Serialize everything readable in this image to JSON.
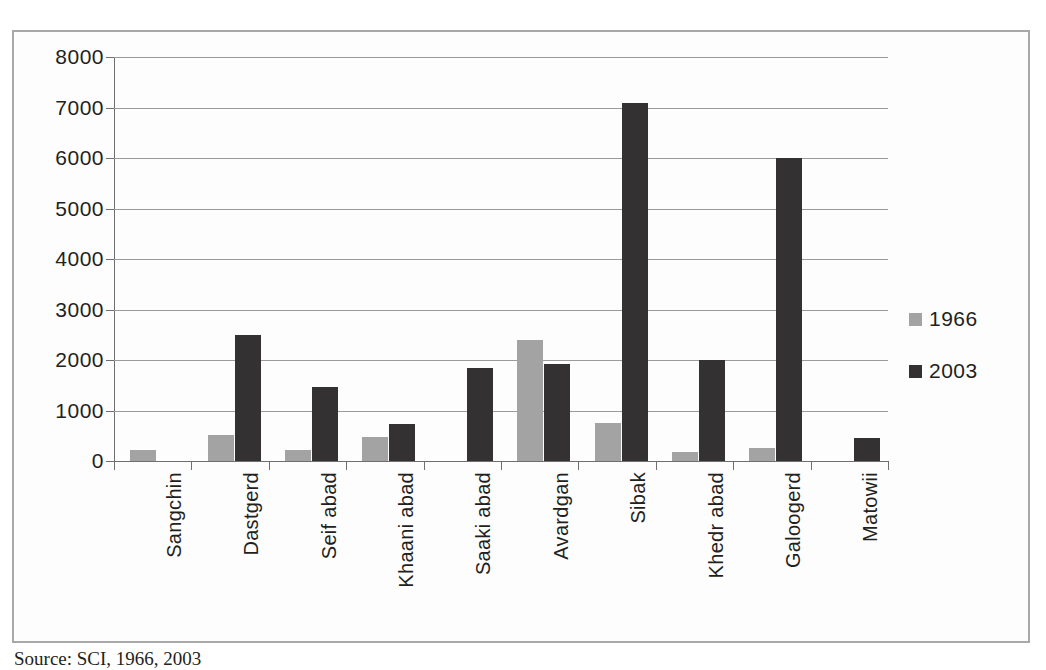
{
  "caption": "Source: SCI, 1966, 2003",
  "legend": {
    "position": "right",
    "entries": [
      {
        "label": "1966",
        "color": "#a3a3a3"
      },
      {
        "label": "2003",
        "color": "#333132"
      }
    ]
  },
  "chart_data": {
    "type": "bar",
    "title": "",
    "xlabel": "",
    "ylabel": "",
    "ylim": [
      0,
      8000
    ],
    "yticks": [
      0,
      1000,
      2000,
      3000,
      4000,
      5000,
      6000,
      7000,
      8000
    ],
    "grid": true,
    "categories": [
      "Sangchin",
      "Dastgerd",
      "Seif abad",
      "Khaani abad",
      "Saaki abad",
      "Avardgan",
      "Sibak",
      "Khedr abad",
      "Galoogerd",
      "Matowii"
    ],
    "series": [
      {
        "name": "1966",
        "color": "#a3a3a3",
        "values": [
          220,
          520,
          220,
          480,
          0,
          2400,
          760,
          180,
          250,
          0
        ]
      },
      {
        "name": "2003",
        "color": "#333132",
        "values": [
          0,
          2500,
          1460,
          730,
          1850,
          1920,
          7080,
          2000,
          6000,
          460
        ]
      }
    ]
  }
}
